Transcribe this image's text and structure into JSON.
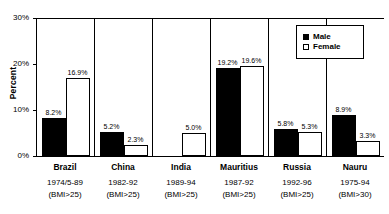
{
  "chart_data": {
    "type": "bar",
    "title": "",
    "xlabel": "",
    "ylabel": "Percent",
    "ylim": [
      0,
      30
    ],
    "ytick_labels": [
      "30%",
      "20%",
      "10%",
      "0%"
    ],
    "ytick_values": [
      30,
      20,
      10,
      0
    ],
    "grid": false,
    "legend_position": "top-right",
    "categories": [
      "Brazil",
      "China",
      "India",
      "Mauritius",
      "Russia",
      "Nauru"
    ],
    "category_subtitles": [
      "1974/5-89",
      "1982-92",
      "1989-94",
      "1987-92",
      "1992-96",
      "1975-94"
    ],
    "category_criteria": [
      "(BMI>25)",
      "(BMI>25)",
      "(BMI>25)",
      "(BMI>25)",
      "(BMI>25)",
      "(BMI>30)"
    ],
    "series": [
      {
        "name": "Male",
        "color": "#000000",
        "values": [
          8.2,
          5.2,
          null,
          19.2,
          5.8,
          8.9
        ],
        "labels": [
          "8.2%",
          "5.2%",
          "",
          "19.2%",
          "5.8%",
          "8.9%"
        ]
      },
      {
        "name": "Female",
        "color": "#ffffff",
        "values": [
          16.9,
          2.3,
          5.0,
          19.6,
          5.3,
          3.3
        ],
        "labels": [
          "16.9%",
          "2.3%",
          "5.0%",
          "19.6%",
          "5.3%",
          "3.3%"
        ]
      }
    ]
  },
  "axis": {
    "y_title": "Percent"
  },
  "legend": {
    "items": [
      {
        "label": "Male",
        "swatch": "filled-square"
      },
      {
        "label": "Female",
        "swatch": "empty-square"
      }
    ]
  }
}
